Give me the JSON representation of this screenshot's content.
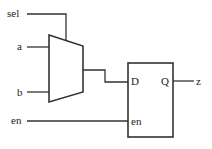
{
  "diagram": {
    "type": "circuit-schematic",
    "inputs": [
      {
        "label": "sel"
      },
      {
        "label": "a"
      },
      {
        "label": "b"
      },
      {
        "label": "en"
      }
    ],
    "mux": {
      "name": "multiplexer"
    },
    "latch": {
      "name": "d-latch",
      "ports": {
        "d": "D",
        "q": "Q",
        "en": "en"
      }
    },
    "output": {
      "label": "z"
    },
    "colors": {
      "stroke": "#333333",
      "background": "#ffffff"
    }
  }
}
